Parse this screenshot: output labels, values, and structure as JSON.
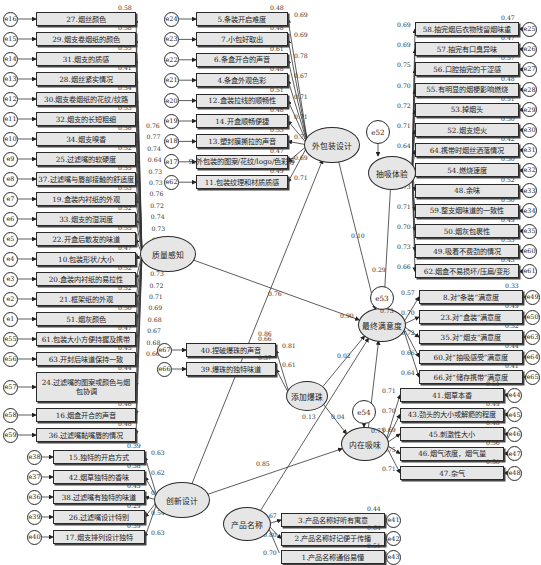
{
  "diagram": {
    "type": "structural-equation-model",
    "latent_variables": {
      "quality": "质量感知",
      "packaging": "外包装设计",
      "smoking": "抽吸体验",
      "satisfaction": "最终满意度",
      "beads": "添加爆珠",
      "intrinsic": "内在吸味",
      "innovation": "创新设计",
      "name": "产品名称"
    },
    "residuals": {
      "e52": "e52",
      "e53": "e53",
      "e54": "e54"
    },
    "quality_items": [
      {
        "err": "e16",
        "label": "27.烟丝颜色",
        "r2": "0.58"
      },
      {
        "err": "e15",
        "label": "29.烟支卷烟纸的颜色",
        "r2": "0.58"
      },
      {
        "err": "e14",
        "label": "31.烟支的质感",
        "r2": "0.55"
      },
      {
        "err": "e13",
        "label": "28.烟丝紧实情况",
        "r2": "0.41"
      },
      {
        "err": "e12",
        "label": "30.烟支卷烟纸的花纹/纹路",
        "r2": "0.54"
      },
      {
        "err": "e11",
        "label": "32.烟支的长短粗细",
        "r2": "0.53"
      },
      {
        "err": "e10",
        "label": "34.烟支嗅香",
        "r2": "0.58"
      },
      {
        "err": "e9",
        "label": "25.过滤嘴的软硬度",
        "r2": "0.52"
      },
      {
        "err": "e8",
        "label": "37.过滤嘴与唇部接触的舒适度",
        "r2": "0.55"
      },
      {
        "err": "e7",
        "label": "19.盒装内衬纸的外观",
        "r2": "0.53"
      },
      {
        "err": "e6",
        "label": "33.烟支的湿润度",
        "r2": "0.52"
      },
      {
        "err": "e5",
        "label": "22.开盒后散发的味道",
        "r2": "0.55"
      },
      {
        "err": "e4",
        "label": "10.包装形状/大小",
        "r2": "0.47"
      },
      {
        "err": "e3",
        "label": "20.盒装内衬纸的易拉性",
        "r2": "0.52"
      },
      {
        "err": "e2",
        "label": "21.框架纸的外观",
        "r2": "0.52"
      },
      {
        "err": "e1",
        "label": "51.烟灰颜色",
        "r2": "0.50"
      },
      {
        "err": "e55",
        "label": "61.包装大小方便持握及携带",
        "r2": "0.47"
      },
      {
        "err": "e56",
        "label": "63.开封后味道保持一致",
        "r2": "0.45"
      },
      {
        "err": "e57",
        "label": "24.过滤嘴的图案或颜色与烟包协调",
        "r2": "0.44"
      },
      {
        "err": "e58",
        "label": "16.烟盒开合的声音",
        "r2": "0.46"
      },
      {
        "err": "e59",
        "label": "36.过滤嘴黏嘴唇的情况",
        "r2": "0.48"
      }
    ],
    "quality_loadings": [
      "0.76",
      "0.77",
      "0.74",
      "0.64",
      "0.73",
      "0.73",
      "0.76",
      "0.72",
      "0.74",
      "0.73",
      "0.72",
      "0.74",
      "0.69",
      "0.73",
      "0.72",
      "0.71",
      "0.69",
      "0.68",
      "0.67",
      "0.68",
      "0.66"
    ],
    "packaging_items": [
      {
        "err": "e24",
        "label": "5.条装开启难度",
        "r2": "0.48",
        "loading": "0.69"
      },
      {
        "err": "e23",
        "label": "7.小包好取出",
        "r2": "0.48",
        "loading": "0.69"
      },
      {
        "err": "e22",
        "label": "6.条盒开合的声音",
        "r2": "0.61",
        "loading": "0.78"
      },
      {
        "err": "e21",
        "label": "4.条盒外观色彩",
        "r2": "0.48",
        "loading": "0.67"
      },
      {
        "err": "e20",
        "label": "12.盒装拉线的顺畅性",
        "r2": "0.51",
        "loading": "0.71"
      },
      {
        "err": "e19",
        "label": "14.开盒顺畅便捷",
        "r2": "0.48",
        "loading": "0.71"
      },
      {
        "err": "e18",
        "label": "13.塑封膜撕拉的声音",
        "r2": "0.53",
        "loading": "0.73"
      },
      {
        "err": "e17",
        "label": "9.外包装的图案/花纹/logo/色彩等",
        "r2": "0.47",
        "loading": "0.69"
      },
      {
        "err": "e62",
        "label": "11.包装纹理和材质质感",
        "r2": "0.49",
        "loading": "0.71"
      }
    ],
    "smoking_items": [
      {
        "err": "e25",
        "label": "58.抽完烟后衣物残留烟味重",
        "r2": "0.47",
        "loading": "0.69"
      },
      {
        "err": "e26",
        "label": "57.抽完有口臭异味",
        "r2": "0.47",
        "loading": "0.69"
      },
      {
        "err": "e27",
        "label": "56.口腔抽完的干涩感",
        "r2": "0.57",
        "loading": "0.75"
      },
      {
        "err": "e28",
        "label": "55.有明显的烟梗影响燃烧",
        "r2": "0.48",
        "loading": "0.70"
      },
      {
        "err": "e29",
        "label": "53.掉烟头",
        "r2": "0.51",
        "loading": "0.72"
      },
      {
        "err": "e30",
        "label": "52.烟支熄火",
        "r2": "0.50",
        "loading": "0.71"
      },
      {
        "err": "e31",
        "label": "64.携带时烟丝洒落情况",
        "r2": "0.42",
        "loading": "0.64"
      },
      {
        "err": "e32",
        "label": "54.燃烧速度",
        "r2": "0.50",
        "loading": "0.71"
      },
      {
        "err": "e33",
        "label": "48.余味",
        "r2": "0.52",
        "loading": "0.73"
      },
      {
        "err": "e34",
        "label": "59.整支烟味道的一致性",
        "r2": "0.50",
        "loading": "0.71"
      },
      {
        "err": "e35",
        "label": "50.烟灰包裹性",
        "r2": "0.49",
        "loading": "0.70"
      },
      {
        "err": "e60",
        "label": "49.吸着不费劲的情况",
        "r2": "0.53",
        "loading": "0.73"
      },
      {
        "err": "e61",
        "label": "62.烟盒不易损坏/压扁/变形",
        "r2": "0.43",
        "loading": "0.66"
      }
    ],
    "satisfaction_items": [
      {
        "err": "e49",
        "label": "8.对“条装”满意度",
        "r2": "0.33",
        "loading": "0.57"
      },
      {
        "err": "e50",
        "label": "23.对“盒装”满意度",
        "r2": "0.49",
        "loading": "0.70"
      },
      {
        "err": "e63",
        "label": "35.对“烟支”满意度",
        "r2": "0.52",
        "loading": "0.72"
      },
      {
        "err": "e64",
        "label": "60.对“抽吸感受”满意度",
        "r2": "0.44",
        "loading": "0.66"
      },
      {
        "err": "e65",
        "label": "66.对“储存携带”满意度",
        "r2": "0.41",
        "loading": "0.64"
      }
    ],
    "intrinsic_items": [
      {
        "err": "e44",
        "label": "41.烟草本香",
        "r2": "0.51",
        "loading": "0.71"
      },
      {
        "err": "e45",
        "label": "43.劲头的大小或解瘾的程度",
        "r2": "0.49",
        "loading": "0.70"
      },
      {
        "err": "e46",
        "label": "45.刺激性大小",
        "r2": "0.48",
        "loading": "0.69"
      },
      {
        "err": "e47",
        "label": "46.烟气浓度，烟气量",
        "r2": "0.56",
        "loading": "0.75"
      },
      {
        "err": "e48",
        "label": "47.杂气",
        "r2": "0.50",
        "loading": "0.71"
      }
    ],
    "beads_items": [
      {
        "err": "e67",
        "label": "40.捏破爆珠的声音",
        "r2": "0.66",
        "loading": "0.81"
      },
      {
        "err": "e66",
        "label": "39.爆珠的独特味道",
        "r2": "0.37",
        "loading": "0.61"
      }
    ],
    "innovation_items": [
      {
        "err": "e38",
        "label": "15.独特的开启方式",
        "r2": "0.39",
        "loading": "0.63"
      },
      {
        "err": "e37",
        "label": "42.烟草独特的香味",
        "r2": "0.38",
        "loading": "0.62"
      },
      {
        "err": "e36",
        "label": "38.过滤嘴有独特的味道",
        "r2": "0.45",
        "loading": "0.67"
      },
      {
        "err": "e39",
        "label": "26.过滤嘴设计特别",
        "r2": "0.29",
        "loading": "0.54"
      },
      {
        "err": "e40",
        "label": "17.烟支排列设计独特",
        "r2": "0.39",
        "loading": "0.63"
      }
    ],
    "name_items": [
      {
        "err": "e41",
        "label": "3.产品名称好听有寓意",
        "r2": "0.44",
        "loading": "0.67"
      },
      {
        "err": "e42",
        "label": "2.产品名称好记便于传播",
        "r2": "0.64",
        "loading": "0.80"
      },
      {
        "err": "e43",
        "label": "1.产品名称通俗易懂",
        "r2": "0.51",
        "loading": "0.70"
      }
    ],
    "paths": {
      "quality_to_satisfaction": "0.76",
      "packaging_to_satisfaction": "0.10",
      "smoking_to_satisfaction": "0.29",
      "innovation_to_packaging": "0.86",
      "intrinsic_to_satisfaction": "0.90",
      "beads_to_satisfaction": "0.02",
      "beads_to_intrinsic": "0.04",
      "name_to_satisfaction": "0.13",
      "innovation_to_intrinsic": "0.85",
      "satisfaction_r2": "0.73",
      "intrinsic_r2": "0.73"
    }
  }
}
